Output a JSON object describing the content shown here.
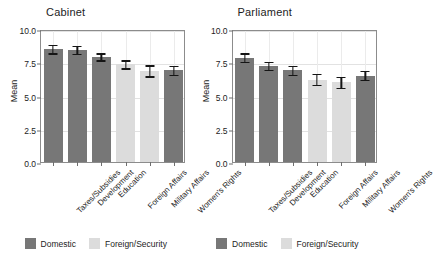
{
  "figure": {
    "ylabel": "Mean",
    "categories": [
      "Taxes/Subsidies",
      "Development",
      "Education",
      "Foreign Affairs",
      "Military Affairs",
      "Women's Rights"
    ],
    "yticks": [
      "0.0",
      "2.5",
      "5.0",
      "7.5",
      "10.0"
    ],
    "legend": {
      "items": [
        {
          "label": "Domestic",
          "color": "#777777",
          "icon": "legend-swatch-domestic"
        },
        {
          "label": "Foreign/Security",
          "color": "#dcdcdc",
          "icon": "legend-swatch-foreign"
        }
      ]
    }
  },
  "chart_data": [
    {
      "type": "bar",
      "title": "Cabinet",
      "xlabel": "",
      "ylabel": "Mean",
      "ylim": [
        0,
        10
      ],
      "yticks": [
        0.0,
        2.5,
        5.0,
        7.5,
        10.0
      ],
      "grid": true,
      "legend_position": "bottom",
      "categories": [
        "Taxes/Subsidies",
        "Development",
        "Education",
        "Foreign Affairs",
        "Military Affairs",
        "Women's Rights"
      ],
      "values": [
        8.5,
        8.45,
        7.9,
        7.35,
        6.85,
        6.9
      ],
      "errors": [
        0.33,
        0.3,
        0.26,
        0.3,
        0.42,
        0.33
      ],
      "groups": [
        "Domestic",
        "Domestic",
        "Domestic",
        "Foreign/Security",
        "Foreign/Security",
        "Domestic"
      ]
    },
    {
      "type": "bar",
      "title": "Parliament",
      "xlabel": "",
      "ylabel": "Mean",
      "ylim": [
        0,
        10
      ],
      "yticks": [
        0.0,
        2.5,
        5.0,
        7.5,
        10.0
      ],
      "grid": true,
      "legend_position": "bottom",
      "categories": [
        "Taxes/Subsidies",
        "Development",
        "Education",
        "Foreign Affairs",
        "Military Affairs",
        "Women's Rights"
      ],
      "values": [
        7.85,
        7.25,
        6.9,
        6.2,
        6.0,
        6.5
      ],
      "errors": [
        0.33,
        0.3,
        0.33,
        0.42,
        0.42,
        0.33
      ],
      "groups": [
        "Domestic",
        "Domestic",
        "Domestic",
        "Foreign/Security",
        "Foreign/Security",
        "Domestic"
      ]
    }
  ]
}
